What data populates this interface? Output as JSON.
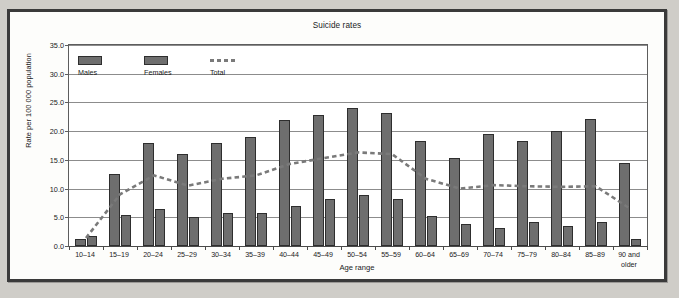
{
  "chart_data": {
    "type": "bar",
    "title": "Suicide rates",
    "xlabel": "Age range",
    "ylabel": "Rate per 100 000 population",
    "ylim": [
      0,
      35
    ],
    "ytick_labels": [
      "0.0",
      "5.0",
      "10.0",
      "15.0",
      "20.0",
      "25.0",
      "30.0",
      "35.0"
    ],
    "ytick_values": [
      0,
      5,
      10,
      15,
      20,
      25,
      30,
      35
    ],
    "grid": true,
    "legend_position": "top-left",
    "categories": [
      "10–14",
      "15–19",
      "20–24",
      "25–29",
      "30–34",
      "35–39",
      "40–44",
      "45–49",
      "50–54",
      "55–59",
      "60–64",
      "65–69",
      "70–74",
      "75–79",
      "80–84",
      "85–89",
      "90 and\nolder"
    ],
    "series": [
      {
        "name": "Males",
        "kind": "bar",
        "color": "#6e6e6e",
        "values": [
          1.2,
          12.5,
          18.0,
          16.0,
          18.0,
          19.0,
          22.0,
          22.8,
          24.0,
          23.2,
          18.2,
          15.4,
          19.5,
          18.2,
          20.0,
          22.2,
          14.5
        ]
      },
      {
        "name": "Females",
        "kind": "bar",
        "color": "#6e6e6e",
        "values": [
          1.8,
          5.4,
          6.4,
          5.1,
          5.7,
          5.7,
          7.0,
          8.1,
          8.8,
          8.1,
          5.3,
          3.8,
          3.1,
          4.2,
          3.4,
          4.1,
          1.2
        ]
      },
      {
        "name": "Total",
        "kind": "line-dashed",
        "color": "#7a7a7a",
        "values": [
          1.4,
          9.0,
          12.3,
          10.5,
          11.7,
          12.3,
          14.3,
          15.3,
          16.3,
          16.0,
          11.7,
          10.0,
          10.6,
          10.4,
          10.3,
          10.4,
          6.5
        ]
      }
    ]
  },
  "legend": {
    "items": [
      {
        "label": "Males",
        "style": "swatch"
      },
      {
        "label": "Females",
        "style": "swatch"
      },
      {
        "label": "Total",
        "style": "dashed"
      }
    ]
  }
}
